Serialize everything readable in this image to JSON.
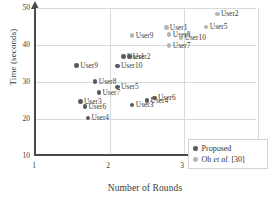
{
  "chart_data": {
    "type": "scatter",
    "title": "",
    "xlabel": "Number of Rounds",
    "ylabel": "Time (seconds)",
    "xlim": [
      1,
      4
    ],
    "ylim": [
      10,
      50
    ],
    "xticks": [
      "1",
      "2",
      "3",
      "4"
    ],
    "yticks": [
      "10",
      "20",
      "30",
      "40",
      "50"
    ],
    "grid": true,
    "legend_position": "bottom-right",
    "series": [
      {
        "name": "Proposed",
        "color": "#5a5a5a",
        "points": [
          {
            "label": "User9",
            "x": 1.55,
            "y": 34.5
          },
          {
            "label": "User8",
            "x": 1.8,
            "y": 30.2
          },
          {
            "label": "User7",
            "x": 1.85,
            "y": 27.2
          },
          {
            "label": "User3",
            "x": 1.6,
            "y": 24.7
          },
          {
            "label": "User6",
            "x": 1.66,
            "y": 23.3
          },
          {
            "label": "User4",
            "x": 1.7,
            "y": 20.3
          },
          {
            "label": "User5",
            "x": 2.1,
            "y": 28.7
          },
          {
            "label": "User10",
            "x": 2.1,
            "y": 34.3
          },
          {
            "label": "User1",
            "x": 2.18,
            "y": 36.9
          },
          {
            "label": "User2",
            "x": 2.26,
            "y": 36.9
          },
          {
            "label": "User3",
            "x": 2.3,
            "y": 23.8
          },
          {
            "label": "User4",
            "x": 2.5,
            "y": 25.0
          },
          {
            "label": "User6",
            "x": 2.6,
            "y": 25.7
          }
        ]
      },
      {
        "name": "Oh et al. [30]",
        "color": "#b6b6b6",
        "points": [
          {
            "label": "User9",
            "x": 2.3,
            "y": 42.5
          },
          {
            "label": "User1",
            "x": 2.76,
            "y": 44.8
          },
          {
            "label": "User8",
            "x": 2.8,
            "y": 42.8
          },
          {
            "label": "User7",
            "x": 2.8,
            "y": 39.8
          },
          {
            "label": "User10",
            "x": 2.96,
            "y": 42.1
          },
          {
            "label": "User5",
            "x": 3.3,
            "y": 44.9
          },
          {
            "label": "User2",
            "x": 3.45,
            "y": 48.4
          }
        ]
      }
    ]
  },
  "legend": {
    "items": [
      {
        "label": "Proposed",
        "italic": "",
        "tail": ""
      },
      {
        "label": "Oh ",
        "italic": "et al.",
        "tail": " [30]"
      }
    ]
  }
}
